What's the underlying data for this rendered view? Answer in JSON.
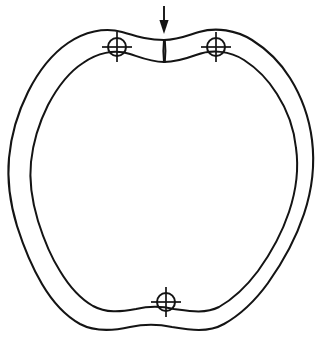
{
  "figure": {
    "title": "Lobed ring cross-section with load arrow and three datum targets",
    "caption": "",
    "background_color": "#ffffff",
    "line_color": "#141414",
    "line_width_px": 2.1,
    "canvas": {
      "width": 322,
      "height": 341
    }
  },
  "geometry": {
    "type": "closed-lobed-ring",
    "lobe_count": 6,
    "outer_contour_label": "outer-contour",
    "inner_contour_label": "inner-contour",
    "wall_thickness_px": 14,
    "outer_bounds": {
      "left": 8,
      "top": 28,
      "right": 313,
      "bottom": 331
    },
    "inner_bounds": {
      "left": 24,
      "top": 44,
      "right": 297,
      "bottom": 315
    }
  },
  "annotations": {
    "load_arrow": {
      "name": "load-arrow",
      "direction": "down",
      "label": "",
      "x": 164,
      "y_start": 6,
      "y_tip": 34
    },
    "notch": {
      "name": "top-center-notch",
      "x": 164,
      "y_top": 40,
      "y_bottom": 62
    },
    "targets": [
      {
        "id": "target-upper-left",
        "cx": 117,
        "cy": 47,
        "r": 9,
        "arm": 6,
        "symbol": "crosshair-target"
      },
      {
        "id": "target-upper-right",
        "cx": 216,
        "cy": 47,
        "r": 9,
        "arm": 6,
        "symbol": "crosshair-target"
      },
      {
        "id": "target-bottom",
        "cx": 166,
        "cy": 302,
        "r": 9,
        "arm": 6,
        "symbol": "crosshair-target"
      }
    ]
  },
  "paths": {
    "outer": "M 164,40 C 178,40 186,36 199,32 C 216,27 236,30 252,40 C 268,50 280,62 290,78 C 300,94 309,116 312,140 C 315,164 312,190 304,214 C 296,238 283,262 268,283 C 255,301 240,315 224,324 C 208,333 190,330 172,327 C 158,324 144,324 130,327 C 112,331 95,332 80,324 C 64,315 52,301 42,284 C 32,267 24,248 17,226 C 10,203 7,180 9,158 C 11,136 18,112 28,92 C 38,72 52,54 68,43 C 84,32 104,27 122,32 C 136,36 148,40 164,40 Z",
    "inner": "M 164,62 C 176,62 185,59 196,55 C 212,49 230,51 244,60 C 258,69 269,81 277,94 C 286,108 294,128 296,148 C 299,169 296,191 289,212 C 282,233 271,253 258,271 C 246,287 233,299 219,307 C 205,314 189,311 174,309 C 161,306 149,306 136,309 C 120,312 106,313 93,306 C 79,298 69,286 60,271 C 51,257 44,240 38,221 C 32,201 29,181 31,162 C 33,143 39,123 48,105 C 57,88 69,72 83,63 C 97,53 114,49 130,54 C 142,58 151,62 164,62 Z"
  }
}
